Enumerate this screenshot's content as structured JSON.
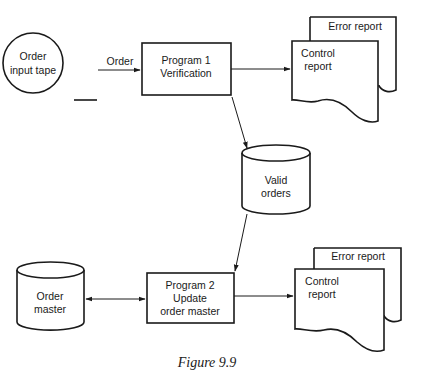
{
  "diagram": {
    "nodes": {
      "order_input_tape": {
        "type": "magnetic-tape",
        "lines": [
          "Order",
          "input tape"
        ]
      },
      "program1": {
        "type": "process",
        "lines": [
          "Program 1",
          "Verification"
        ]
      },
      "error_report_1": {
        "type": "document",
        "lines": [
          "Error report"
        ]
      },
      "control_report_1": {
        "type": "document",
        "lines": [
          "Control",
          "report"
        ]
      },
      "valid_orders": {
        "type": "disk-storage",
        "lines": [
          "Valid",
          "orders"
        ]
      },
      "order_master": {
        "type": "disk-storage",
        "lines": [
          "Order",
          "master"
        ]
      },
      "program2": {
        "type": "process",
        "lines": [
          "Program 2",
          "Update",
          "order master"
        ]
      },
      "error_report_2": {
        "type": "document",
        "lines": [
          "Error report"
        ]
      },
      "control_report_2": {
        "type": "document",
        "lines": [
          "Control",
          "report"
        ]
      }
    },
    "edges": [
      {
        "from": "order_input_tape",
        "to": "program1",
        "label": "Order"
      },
      {
        "from": "program1",
        "to": "control_report_1",
        "label": ""
      },
      {
        "from": "program1",
        "to": "valid_orders",
        "label": ""
      },
      {
        "from": "valid_orders",
        "to": "program2",
        "label": ""
      },
      {
        "from": "order_master",
        "to": "program2",
        "label": "",
        "bidirectional": true
      },
      {
        "from": "program2",
        "to": "control_report_2",
        "label": ""
      }
    ],
    "caption": "Figure 9.9"
  }
}
